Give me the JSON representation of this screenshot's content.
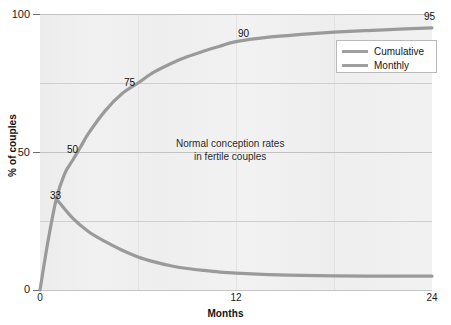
{
  "chart_data": {
    "type": "line",
    "title": "",
    "xlabel": "Months",
    "ylabel": "% of couples",
    "xlim": [
      0,
      24
    ],
    "ylim": [
      0,
      100
    ],
    "grid": true,
    "legend_position": "top-right",
    "x_ticks": [
      "0",
      "12",
      "24"
    ],
    "x_tick_values": [
      0,
      12,
      24
    ],
    "y_ticks": [
      "0",
      "50",
      "100"
    ],
    "y_tick_values": [
      0,
      50,
      100
    ],
    "gridlines_y": [
      0,
      25,
      50,
      75,
      100
    ],
    "gridlines_x": [
      6,
      12,
      18
    ],
    "annotation_line1": "Normal conception rates",
    "annotation_line2": "in fertile couples",
    "series": [
      {
        "name": "Cumulative",
        "color": "#9a9a9a",
        "x": [
          0,
          0.5,
          1,
          1.5,
          2,
          2.5,
          3,
          4,
          5,
          6,
          7,
          8,
          9,
          10,
          11,
          12,
          14,
          16,
          18,
          20,
          22,
          24
        ],
        "values": [
          0,
          18,
          33,
          42,
          47,
          52,
          57,
          65,
          71,
          75,
          79,
          82,
          84.5,
          86.5,
          88.3,
          90,
          91.6,
          92.6,
          93.4,
          94,
          94.5,
          95
        ]
      },
      {
        "name": "Monthly",
        "color": "#9a9a9a",
        "x": [
          1,
          2,
          3,
          4,
          5,
          6,
          7,
          8,
          9,
          10,
          11,
          12,
          14,
          16,
          18,
          20,
          22,
          24
        ],
        "values": [
          33,
          26,
          21,
          17.5,
          14.5,
          12,
          10.2,
          8.8,
          7.8,
          7.1,
          6.5,
          6.1,
          5.6,
          5.3,
          5.1,
          5.0,
          5.0,
          5.0
        ]
      }
    ],
    "point_labels": [
      {
        "text": "33",
        "x": 1,
        "y": 33
      },
      {
        "text": "50",
        "x": 2.5,
        "y": 52
      },
      {
        "text": "75",
        "x": 6,
        "y": 75
      },
      {
        "text": "90",
        "x": 12,
        "y": 90
      },
      {
        "text": "95",
        "x": 24,
        "y": 95
      }
    ]
  },
  "axes": {
    "y_title": "% of couples",
    "x_title": "Months",
    "y_tick_labels": [
      "100",
      "50",
      "0"
    ],
    "x_tick_labels": [
      "0",
      "12",
      "24"
    ]
  },
  "legend": {
    "items": [
      {
        "label": "Cumulative",
        "color": "#a0a0a0"
      },
      {
        "label": "Monthly",
        "color": "#a0a0a0"
      }
    ]
  },
  "annotation": {
    "line1": "Normal conception rates",
    "line2": "in fertile couples"
  },
  "point_labels": {
    "p33": "33",
    "p50": "50",
    "p75": "75",
    "p90": "90",
    "p95": "95"
  },
  "colors": {
    "plot_background": "#eeeeee",
    "gridline": "#cfcfcf",
    "series_line": "#9a9a9a",
    "text": "#111111"
  }
}
